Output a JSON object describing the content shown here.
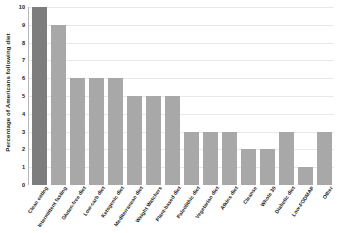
{
  "chart_data": {
    "type": "bar",
    "title": "",
    "xlabel": "",
    "ylabel": "Percentage of Americans following diet",
    "ylim": [
      0,
      10
    ],
    "grid": true,
    "legend": "none",
    "orientation": "vertical",
    "y_ticks": [
      0,
      1,
      2,
      3,
      4,
      5,
      6,
      7,
      8,
      9,
      10
    ],
    "categories": [
      "Clean eating",
      "Intermittent fasting",
      "Gluten-free diet",
      "Low-carb diet",
      "Ketogenic diet",
      "Mediterranean diet",
      "Weight Watchers",
      "Plant-based diet",
      "Paleolithic diet",
      "Vegetarian diet",
      "Atkins diet",
      "Cleanse",
      "Whole 30",
      "Diabetic diet",
      "Low-FODMAP",
      "Other"
    ],
    "values": [
      10,
      9,
      6,
      6,
      6,
      5,
      5,
      5,
      3,
      3,
      3,
      2,
      2,
      3,
      1,
      3
    ],
    "bar_colors": [
      "#7d7d7d",
      "#a8a8a8",
      "#a8a8a8",
      "#a8a8a8",
      "#a8a8a8",
      "#a8a8a8",
      "#a8a8a8",
      "#a8a8a8",
      "#a8a8a8",
      "#a8a8a8",
      "#a8a8a8",
      "#a8a8a8",
      "#a8a8a8",
      "#a8a8a8",
      "#a8a8a8",
      "#a8a8a8"
    ],
    "highlight_index": 0,
    "colors": {
      "bar_default": "#a8a8a8",
      "bar_highlight": "#7d7d7d",
      "gridline": "#e9e9e9",
      "axis": "#b8b8b8",
      "text": "#1a1a1a",
      "background": "#ffffff"
    }
  }
}
